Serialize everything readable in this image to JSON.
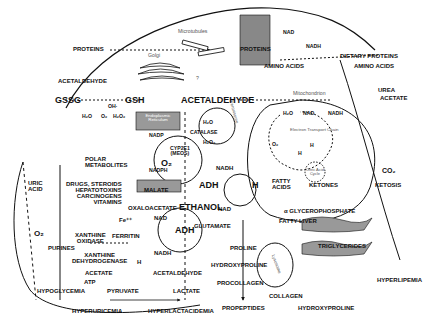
{
  "diagram": {
    "organelles": {
      "microtubules": "Microtubules",
      "golgi": "Golgi",
      "golgi_question": "?",
      "er": "Endoplasmic Reticulum",
      "mitochondrion": "Mitochondrion",
      "peroxisome": "Peroxisome",
      "lysosome": "Lysosome",
      "etc": "Electron Transport Chain",
      "citric_cycle": "Citric Acid Cycle"
    },
    "labels": {
      "proteins_out": "PROTEINS",
      "proteins_in": "PROTEINS",
      "acetaldehyde_left": "ACETALDEHYDE",
      "acetaldehyde_main": "ACETALDEHYDE",
      "acetaldehyde_low": "ACETALDEHYDE",
      "gssg": "GSSG",
      "gsh": "GSH",
      "oh": "OH·",
      "h2o_a": "H₂O",
      "o2_a": "O₂",
      "h2o2_a": "H₂O₂",
      "nadp": "NADP",
      "nadph": "NADPH",
      "cyp2e1": "CYP2E1\n(MEOS)",
      "o2_er": "O₂",
      "polar_metabolites": "POLAR\nMETABOLITES",
      "drugs": "DRUGS, STEROIDS\nHEPATOTOXINS\nCARCINOGENS\nVITAMINS",
      "malate": "MALATE",
      "oxaloacetate": "OXALOACETATE",
      "ethanol": "ETHANOL",
      "adh_upper": "ADH",
      "adh_lower": "ADH",
      "catalase": "CATALASE",
      "h2o_cat": "H₂O",
      "h2o2_cat": "H₂O₂",
      "nad_top": "NAD",
      "nadh_top": "NADH",
      "dietary_proteins": "DIETARY PROTEINS",
      "amino_acids_in": "AMINO ACIDS",
      "amino_acids_out": "AMINO ACIDS",
      "urea": "UREA",
      "acetate_out": "ACETATE",
      "h2o_mito": "H₂O",
      "nad_mito": "NAD",
      "nadh_mito": "NADH",
      "o2_mito": "O₂",
      "h_mito1": "H",
      "h_mito2": "H",
      "co2": "CO₂",
      "nadh_mid": "NADH",
      "nad_mid": "NAD",
      "h_big": "H",
      "fatty_acids": "FATTY\nACIDS",
      "ketones": "KETONES",
      "ketosis": "KETOSIS",
      "glycerophosphate": "α GLYCEROPHOSPHATE",
      "fatty_liver": "FATTY LIVER",
      "triglycerides": "TRIGLYCERIDES",
      "hyperlipemia": "HYPERLIPEMIA",
      "glutamate": "GLUTAMATE",
      "proline": "PROLINE",
      "hydroxyproline_in": "HYDROXYPROLINE",
      "procollagen": "PROCOLLAGEN",
      "collagen": "COLLAGEN",
      "hydroxyproline_out": "HYDROXYPROLINE",
      "propeptides": "PROPEPTIDES",
      "uric_acid": "URIC\nACID",
      "o2_left": "O₂",
      "fe": "Fe⁺⁺",
      "nad_low": "NAD",
      "nadh_low": "NADH",
      "ferritin": "FERRITIN",
      "xanthine_oxidase": "XANTHINE\nOXIDASE",
      "purines": "PURINES",
      "xanthine_dh": "XANTHINE\nDEHYDROGENASE",
      "h_low": "H",
      "acetate_low": "ACETATE",
      "atp": "ATP",
      "hypoglycemia": "HYPOGLYCEMIA",
      "pyruvate": "PYRUVATE",
      "lactate": "LACTATE",
      "hyperuricemia": "HYPERURICEMIA",
      "hyperlactacidemia": "HYPERLACTACIDEMIA"
    }
  }
}
